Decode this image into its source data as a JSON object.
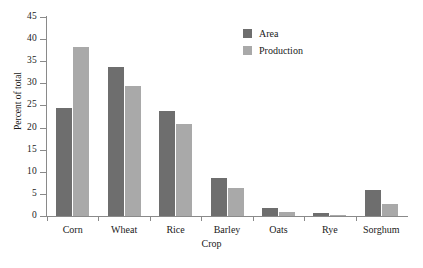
{
  "chart_data": {
    "type": "bar",
    "title": "",
    "xlabel": "Crop",
    "ylabel": "Percent of total",
    "categories": [
      "Corn",
      "Wheat",
      "Rice",
      "Barley",
      "Oats",
      "Rye",
      "Sorghum"
    ],
    "series": [
      {
        "name": "Area",
        "color": "#6e6e6e",
        "values": [
          24.5,
          33.6,
          23.7,
          8.6,
          1.7,
          0.6,
          5.8
        ]
      },
      {
        "name": "Production",
        "color": "#a9a9a9",
        "values": [
          38.2,
          29.4,
          20.8,
          6.3,
          0.9,
          0.3,
          2.7
        ]
      }
    ],
    "ylim": [
      0,
      45
    ],
    "yticks": [
      0,
      5,
      10,
      15,
      20,
      25,
      30,
      35,
      40,
      45
    ],
    "ytick_labels": [
      "0",
      "5",
      "10",
      "15",
      "20",
      "25",
      "30",
      "35",
      "40",
      "45"
    ],
    "grid": false,
    "legend_position": "top-right",
    "axis_color": "#8a8a8a",
    "background": "#ffffff"
  }
}
